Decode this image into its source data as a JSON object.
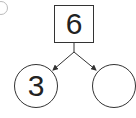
{
  "diagram": {
    "type": "number-bond",
    "whole": "6",
    "parts": [
      "3",
      ""
    ]
  }
}
